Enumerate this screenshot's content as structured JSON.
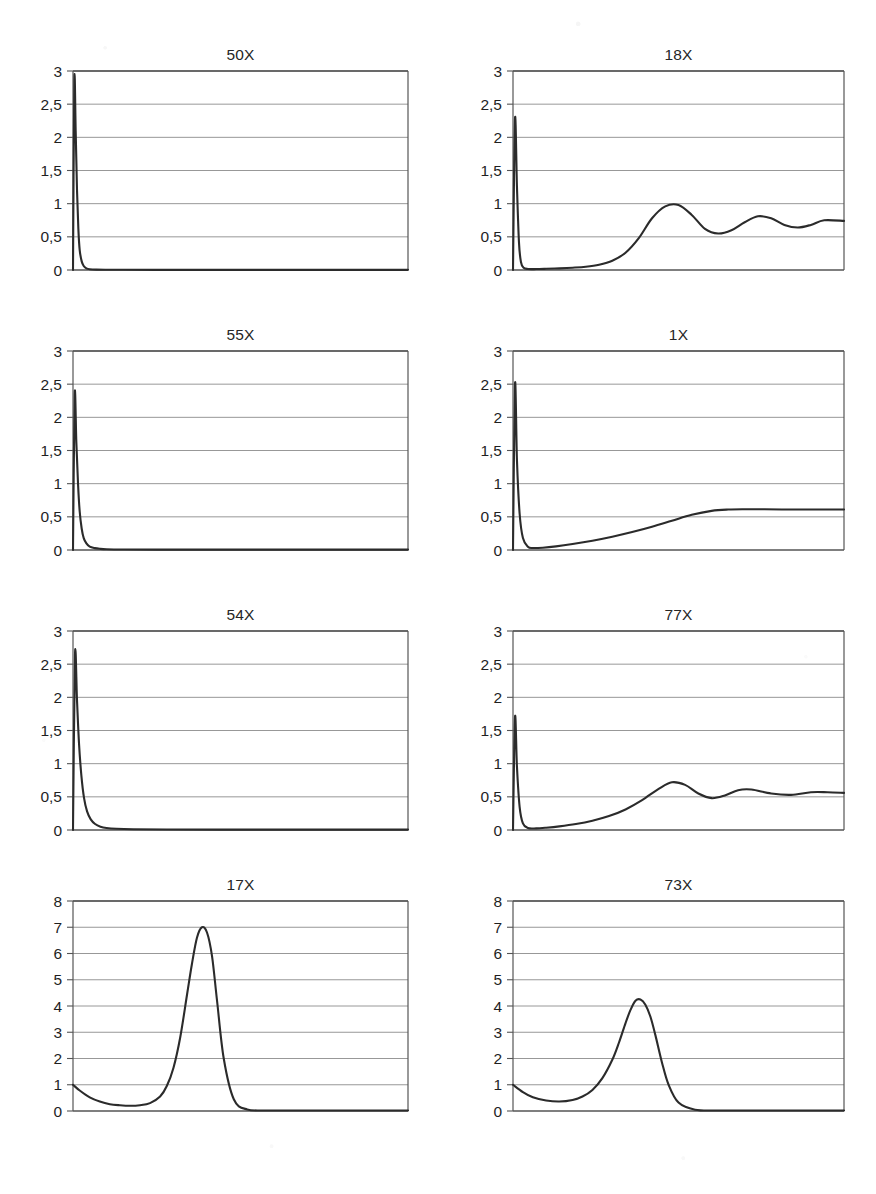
{
  "figure": {
    "background_color": "#ffffff",
    "line_color": "#2b2b2b",
    "grid_color": "#8c8c8c",
    "axis_color": "#555555",
    "text_color": "#262626",
    "rows": 4,
    "columns": 2,
    "decimal_separator": ","
  },
  "chart_data": [
    {
      "type": "line",
      "title": "50X",
      "xlabel": "",
      "ylabel": "",
      "ylim": [
        0,
        3
      ],
      "xlim": [
        0,
        1
      ],
      "ytick_labels": [
        "0",
        "0,5",
        "1",
        "1,5",
        "2",
        "2,5",
        "3"
      ],
      "ytick_values": [
        0,
        0.5,
        1,
        1.5,
        2,
        2.5,
        3
      ],
      "grid": true,
      "legend": "none",
      "x": [
        0,
        0.004,
        0.008,
        0.012,
        0.016,
        0.02,
        0.026,
        0.032,
        0.04,
        0.05,
        0.07,
        0.1,
        0.15,
        0.25,
        0.4,
        0.6,
        0.8,
        1.0
      ],
      "y": [
        0.0,
        2.87,
        2.1,
        1.2,
        0.62,
        0.3,
        0.13,
        0.06,
        0.025,
        0.012,
        0.006,
        0.004,
        0.003,
        0.002,
        0.002,
        0.002,
        0.002,
        0.002
      ]
    },
    {
      "type": "line",
      "title": "18X",
      "xlabel": "",
      "ylabel": "",
      "ylim": [
        0,
        3
      ],
      "xlim": [
        0,
        1
      ],
      "ytick_labels": [
        "0",
        "0,5",
        "1",
        "1,5",
        "2",
        "2,5",
        "3"
      ],
      "ytick_values": [
        0,
        0.5,
        1,
        1.5,
        2,
        2.5,
        3
      ],
      "grid": true,
      "legend": "none",
      "x": [
        0,
        0.006,
        0.012,
        0.018,
        0.024,
        0.032,
        0.045,
        0.07,
        0.1,
        0.14,
        0.18,
        0.22,
        0.26,
        0.3,
        0.34,
        0.38,
        0.42,
        0.46,
        0.5,
        0.54,
        0.58,
        0.62,
        0.66,
        0.7,
        0.74,
        0.78,
        0.82,
        0.86,
        0.9,
        0.94,
        1.0
      ],
      "y": [
        0.0,
        2.28,
        1.25,
        0.42,
        0.12,
        0.035,
        0.015,
        0.014,
        0.018,
        0.025,
        0.035,
        0.05,
        0.08,
        0.14,
        0.26,
        0.48,
        0.78,
        0.96,
        0.98,
        0.83,
        0.62,
        0.55,
        0.6,
        0.72,
        0.81,
        0.78,
        0.68,
        0.64,
        0.68,
        0.75,
        0.74
      ]
    },
    {
      "type": "line",
      "title": "55X",
      "xlabel": "",
      "ylabel": "",
      "ylim": [
        0,
        3
      ],
      "xlim": [
        0,
        1
      ],
      "ytick_labels": [
        "0",
        "0,5",
        "1",
        "1,5",
        "2",
        "2,5",
        "3"
      ],
      "ytick_values": [
        0,
        0.5,
        1,
        1.5,
        2,
        2.5,
        3
      ],
      "grid": true,
      "legend": "none",
      "x": [
        0,
        0.005,
        0.01,
        0.015,
        0.02,
        0.026,
        0.032,
        0.04,
        0.05,
        0.065,
        0.08,
        0.1,
        0.15,
        0.25,
        0.4,
        0.6,
        0.8,
        1.0
      ],
      "y": [
        0.0,
        2.35,
        1.62,
        1.0,
        0.58,
        0.32,
        0.18,
        0.1,
        0.05,
        0.028,
        0.018,
        0.012,
        0.008,
        0.006,
        0.005,
        0.005,
        0.005,
        0.005
      ]
    },
    {
      "type": "line",
      "title": "1X",
      "xlabel": "",
      "ylabel": "",
      "ylim": [
        0,
        3
      ],
      "xlim": [
        0,
        1
      ],
      "ytick_labels": [
        "0",
        "0,5",
        "1",
        "1,5",
        "2",
        "2,5",
        "3"
      ],
      "ytick_values": [
        0,
        0.5,
        1,
        1.5,
        2,
        2.5,
        3
      ],
      "grid": true,
      "legend": "none",
      "x": [
        0,
        0.006,
        0.012,
        0.02,
        0.03,
        0.045,
        0.06,
        0.09,
        0.13,
        0.18,
        0.24,
        0.3,
        0.36,
        0.42,
        0.48,
        0.54,
        0.6,
        0.65,
        0.7,
        0.76,
        0.84,
        0.92,
        1.0
      ],
      "y": [
        0.0,
        2.5,
        1.35,
        0.55,
        0.18,
        0.05,
        0.03,
        0.035,
        0.055,
        0.09,
        0.14,
        0.2,
        0.27,
        0.35,
        0.44,
        0.53,
        0.59,
        0.61,
        0.615,
        0.615,
        0.61,
        0.61,
        0.61
      ]
    },
    {
      "type": "line",
      "title": "54X",
      "xlabel": "",
      "ylabel": "",
      "ylim": [
        0,
        3
      ],
      "xlim": [
        0,
        1
      ],
      "ytick_labels": [
        "0",
        "0,5",
        "1",
        "1,5",
        "2",
        "2,5",
        "3"
      ],
      "ytick_values": [
        0,
        0.5,
        1,
        1.5,
        2,
        2.5,
        3
      ],
      "grid": true,
      "legend": "none",
      "x": [
        0,
        0.006,
        0.012,
        0.018,
        0.025,
        0.033,
        0.042,
        0.053,
        0.066,
        0.082,
        0.1,
        0.13,
        0.18,
        0.28,
        0.45,
        0.65,
        0.85,
        1.0
      ],
      "y": [
        0.0,
        2.65,
        1.95,
        1.3,
        0.82,
        0.48,
        0.28,
        0.16,
        0.09,
        0.05,
        0.03,
        0.018,
        0.011,
        0.007,
        0.005,
        0.005,
        0.005,
        0.005
      ]
    },
    {
      "type": "line",
      "title": "77X",
      "xlabel": "",
      "ylabel": "",
      "ylim": [
        0,
        3
      ],
      "xlim": [
        0,
        1
      ],
      "ytick_labels": [
        "0",
        "0,5",
        "1",
        "1,5",
        "2",
        "2,5",
        "3"
      ],
      "ytick_values": [
        0,
        0.5,
        1,
        1.5,
        2,
        2.5,
        3
      ],
      "grid": true,
      "legend": "none",
      "x": [
        0,
        0.006,
        0.012,
        0.02,
        0.03,
        0.045,
        0.07,
        0.1,
        0.14,
        0.19,
        0.24,
        0.29,
        0.34,
        0.39,
        0.44,
        0.48,
        0.52,
        0.56,
        0.6,
        0.64,
        0.68,
        0.72,
        0.78,
        0.84,
        0.9,
        0.95,
        1.0
      ],
      "y": [
        0.0,
        1.7,
        0.95,
        0.35,
        0.1,
        0.03,
        0.025,
        0.035,
        0.055,
        0.09,
        0.14,
        0.21,
        0.31,
        0.45,
        0.62,
        0.72,
        0.68,
        0.55,
        0.48,
        0.52,
        0.6,
        0.61,
        0.55,
        0.53,
        0.57,
        0.57,
        0.56
      ]
    },
    {
      "type": "line",
      "title": "17X",
      "xlabel": "",
      "ylabel": "",
      "ylim": [
        0,
        8
      ],
      "xlim": [
        0,
        1
      ],
      "ytick_labels": [
        "0",
        "1",
        "2",
        "3",
        "4",
        "5",
        "6",
        "7",
        "8"
      ],
      "ytick_values": [
        0,
        1,
        2,
        3,
        4,
        5,
        6,
        7,
        8
      ],
      "grid": true,
      "legend": "none",
      "x": [
        0,
        0.02,
        0.05,
        0.08,
        0.11,
        0.14,
        0.17,
        0.2,
        0.23,
        0.26,
        0.28,
        0.3,
        0.32,
        0.34,
        0.355,
        0.37,
        0.385,
        0.4,
        0.415,
        0.43,
        0.45,
        0.48,
        0.52,
        0.6,
        0.7,
        0.85,
        1.0
      ],
      "y": [
        1.0,
        0.78,
        0.52,
        0.36,
        0.26,
        0.22,
        0.2,
        0.22,
        0.3,
        0.55,
        0.95,
        1.65,
        2.8,
        4.4,
        5.6,
        6.6,
        7.0,
        6.8,
        5.9,
        4.2,
        2.0,
        0.45,
        0.06,
        0.02,
        0.02,
        0.02,
        0.02
      ]
    },
    {
      "type": "line",
      "title": "73X",
      "xlabel": "",
      "ylabel": "",
      "ylim": [
        0,
        8
      ],
      "xlim": [
        0,
        1
      ],
      "ytick_labels": [
        "0",
        "1",
        "2",
        "3",
        "4",
        "5",
        "6",
        "7",
        "8"
      ],
      "ytick_values": [
        0,
        1,
        2,
        3,
        4,
        5,
        6,
        7,
        8
      ],
      "grid": true,
      "legend": "none",
      "x": [
        0,
        0.03,
        0.06,
        0.1,
        0.14,
        0.18,
        0.21,
        0.24,
        0.27,
        0.3,
        0.32,
        0.34,
        0.355,
        0.37,
        0.385,
        0.4,
        0.415,
        0.43,
        0.45,
        0.47,
        0.5,
        0.55,
        0.62,
        0.72,
        0.85,
        1.0
      ],
      "y": [
        1.0,
        0.72,
        0.52,
        0.4,
        0.36,
        0.42,
        0.55,
        0.8,
        1.25,
        1.95,
        2.6,
        3.35,
        3.85,
        4.2,
        4.25,
        4.05,
        3.6,
        2.9,
        1.85,
        1.0,
        0.32,
        0.05,
        0.02,
        0.02,
        0.02,
        0.02
      ]
    }
  ]
}
